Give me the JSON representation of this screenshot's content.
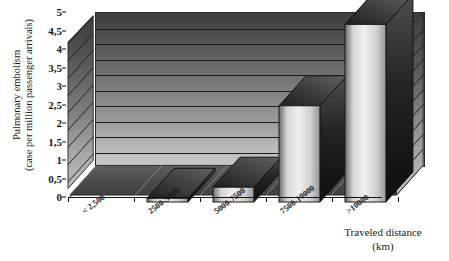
{
  "chart_data": {
    "type": "bar",
    "title": "",
    "subtitle": "",
    "categories": [
      "< 2,500",
      "2500-5000",
      "5000-7500",
      "7500-10000",
      ">10000"
    ],
    "values": [
      0,
      0.1,
      0.4,
      2.6,
      4.8
    ],
    "series": [
      {
        "name": "Pulmonary embolism (case per million passenger arrivals)",
        "values": [
          0,
          0.1,
          0.4,
          2.6,
          4.8
        ]
      }
    ],
    "xlabel": "Traveled distance (km)",
    "ylabel": "Pulmonary embolism (case per million passenger arrivals)",
    "ylim": [
      0,
      5
    ],
    "ytick_step": 0.5,
    "yticks": [
      "0",
      "0,5",
      "1",
      "1,5",
      "2",
      "2,5",
      "3",
      "3,5",
      "4",
      "4,5",
      "5"
    ],
    "ytick_values": [
      0,
      0.5,
      1,
      1.5,
      2,
      2.5,
      3,
      3.5,
      4,
      4.5,
      5
    ],
    "grid": true,
    "grid_axis": "y",
    "legend": false,
    "legend_position": "none",
    "style": "3d",
    "decimal_separator": ","
  },
  "axes": {
    "y_title_line1": "Pulmonary embolism",
    "y_title_line2": "(case per million passenger arrivals)",
    "x_title_line1": "Traveled distance",
    "x_title_line2": "(km)"
  },
  "colors": {
    "background": "#ffffff",
    "text": "#1a1a1a",
    "axis": "#111111",
    "bar_front_light": "#efefef",
    "bar_front_dark": "#6f6f6f",
    "bar_side": "#1e1e1e",
    "bar_top": "#3a3a3a",
    "wall_top": "#3d3d3d",
    "wall_bottom": "#c9c9c9",
    "floor": "#4f4f4f",
    "gridline": "#1b1b1b"
  }
}
